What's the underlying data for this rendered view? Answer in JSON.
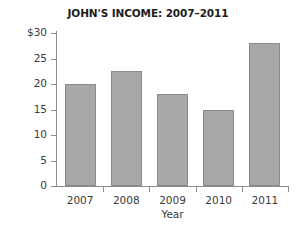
{
  "chart_data": {
    "type": "bar",
    "title": "JOHN'S INCOME: 2007–2011",
    "xlabel": "Year",
    "ylabel": "Income  (in thousands)",
    "categories": [
      "2007",
      "2008",
      "2009",
      "2010",
      "2011"
    ],
    "values": [
      20,
      22.5,
      18,
      15,
      28
    ],
    "series": [
      {
        "name": "Income",
        "values": [
          20,
          22.5,
          18,
          15,
          28
        ]
      }
    ],
    "ylim": [
      0,
      30
    ],
    "yticks": [
      0,
      5,
      10,
      15,
      20,
      25,
      30
    ],
    "ytick_labels": [
      "0",
      "5",
      "10",
      "15",
      "20",
      "25",
      "$30"
    ],
    "grid": false,
    "legend": false,
    "legend_position": "none",
    "bar_color": "#a8a8a8",
    "bar_edge_color": "#8a8a8a",
    "axis_color": "#8d8d8d",
    "background_color": "#ffffff",
    "text_color": "#3a3a3a",
    "title_color": "#1d1d1d"
  }
}
